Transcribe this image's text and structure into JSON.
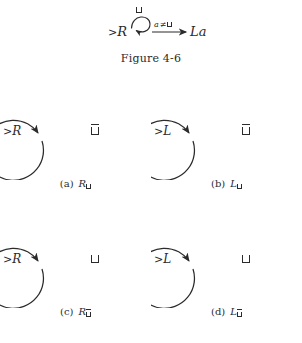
{
  "figure": {
    "caption": "Figure 4-6",
    "top_machine": {
      "start_state": ">R",
      "start_state_marker": ">",
      "start_state_name": "R",
      "self_loop_label": "blank-symbol",
      "self_loop_label_text": "⊔",
      "transition_label": "a ≠ ⊔",
      "transition_label_parts": {
        "variable": "a",
        "relation": "≠",
        "symbol": "⊔"
      },
      "target_state": "La",
      "target_state_head": "L",
      "target_state_arg": "a"
    }
  },
  "panels": [
    {
      "id": "a",
      "tag": "(a)",
      "state_marker": ">",
      "state_name": "R",
      "state_label": ">R",
      "loop_symbol": "⊔",
      "loop_symbol_barred": true,
      "caption_symbol": "R",
      "caption_subscript": "⊔",
      "caption_subscript_barred": false,
      "caption_full": "(a)  R⊔"
    },
    {
      "id": "b",
      "tag": "(b)",
      "state_marker": ">",
      "state_name": "L",
      "state_label": ">L",
      "loop_symbol": "⊔",
      "loop_symbol_barred": true,
      "caption_symbol": "L",
      "caption_subscript": "⊔",
      "caption_subscript_barred": false,
      "caption_full": "(b)  L⊔"
    },
    {
      "id": "c",
      "tag": "(c)",
      "state_marker": ">",
      "state_name": "R",
      "state_label": ">R",
      "loop_symbol": "⊔",
      "loop_symbol_barred": false,
      "caption_symbol": "R",
      "caption_subscript": "⊔",
      "caption_subscript_barred": true,
      "caption_full": "(c)  R⊔̄"
    },
    {
      "id": "d",
      "tag": "(d)",
      "state_marker": ">",
      "state_name": "L",
      "state_label": ">L",
      "loop_symbol": "⊔",
      "loop_symbol_barred": false,
      "caption_symbol": "L",
      "caption_subscript": "⊔",
      "caption_subscript_barred": true,
      "caption_full": "(d)  L⊔̄"
    }
  ],
  "colors": {
    "ink": "#2b2b2b",
    "background": "#ffffff"
  }
}
